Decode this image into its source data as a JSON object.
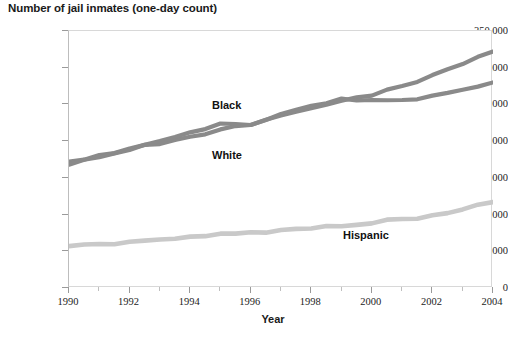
{
  "chart_data": {
    "type": "line",
    "title": "Number of jail inmates (one-day count)",
    "xlabel": "Year",
    "ylabel": "",
    "xlim": [
      1990,
      2004
    ],
    "ylim": [
      0,
      350000
    ],
    "grid": false,
    "legend_position": "inline-annotations",
    "x_tick_labels": [
      "1990",
      "1992",
      "1994",
      "1996",
      "1998",
      "2000",
      "2002",
      "2004"
    ],
    "x_ticks": [
      1990,
      1992,
      1994,
      1996,
      1998,
      2000,
      2002,
      2004
    ],
    "x_minor_ticks": [
      1991,
      1993,
      1995,
      1997,
      1999,
      2001,
      2003
    ],
    "y_tick_labels": [
      "0",
      "50,000",
      "100,000",
      "150,000",
      "200,000",
      "250,000",
      "300,000",
      "350,000"
    ],
    "y_ticks": [
      0,
      50000,
      100000,
      150000,
      200000,
      250000,
      300000,
      350000
    ],
    "x": [
      1990,
      1991,
      1992,
      1993,
      1994,
      1995,
      1996,
      1997,
      1998,
      1999,
      2000,
      2001,
      2002,
      2003,
      2004
    ],
    "series": [
      {
        "name": "Black",
        "color": "#8a8a8a",
        "values": [
          172000,
          181000,
          190000,
          196000,
          206000,
          216000,
          222000,
          235000,
          245000,
          255000,
          262000,
          275000,
          290000,
          305000,
          322000
        ]
      },
      {
        "name": "White",
        "color": "#8a8a8a",
        "values": [
          168000,
          178000,
          188000,
          200000,
          212000,
          224000,
          222000,
          237000,
          248000,
          258000,
          256000,
          256000,
          262000,
          270000,
          280000
        ]
      },
      {
        "name": "Hispanic",
        "color": "#c9c9c9",
        "values": [
          57000,
          60000,
          63000,
          66000,
          70000,
          74000,
          76000,
          79000,
          81000,
          84000,
          88000,
          94000,
          99000,
          107000,
          117000
        ]
      }
    ],
    "annotations": [
      {
        "label": "Black",
        "x": 1996,
        "y": 242000
      },
      {
        "label": "White",
        "x": 1996,
        "y": 175000
      },
      {
        "label": "Hispanic",
        "x": 2001,
        "y": 62000
      }
    ]
  }
}
